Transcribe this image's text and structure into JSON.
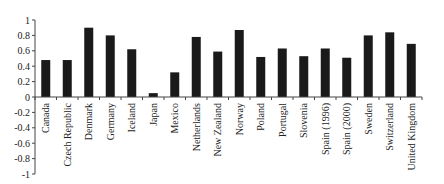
{
  "chart_data": {
    "type": "bar",
    "title": "",
    "xlabel": "",
    "ylabel": "",
    "ylim": [
      -1,
      1
    ],
    "yticks": [
      1,
      0.8,
      0.6,
      0.4,
      0.2,
      0,
      -0.2,
      -0.4,
      -0.6,
      -0.8,
      -1
    ],
    "ytick_labels": [
      "1",
      "0.8",
      "0.6",
      "0.4",
      "0.2",
      "0",
      "-0.2",
      "-0.4",
      "-0.6",
      "-0.8",
      "-1"
    ],
    "grid": false,
    "legend": null,
    "bar_color": "#1a1a1a",
    "categories": [
      "Canada",
      "Czech Republic",
      "Denmark",
      "Germany",
      "Iceland",
      "Japan",
      "Mexico",
      "Netherlands",
      "New Zealand",
      "Norway",
      "Poland",
      "Portugal",
      "Slovenia",
      "Spain (1996)",
      "Spain (2000)",
      "Sweden",
      "Switzerland",
      "United Kingdom"
    ],
    "values": [
      0.48,
      0.48,
      0.9,
      0.8,
      0.62,
      0.05,
      0.32,
      0.78,
      0.59,
      0.87,
      0.52,
      0.63,
      0.53,
      0.63,
      0.51,
      0.8,
      0.84,
      0.69
    ]
  }
}
